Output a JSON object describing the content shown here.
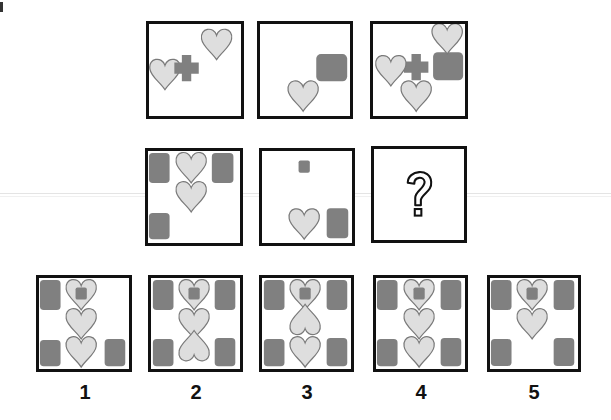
{
  "puzzle": {
    "type": "visual-analogy-matrix",
    "colors": {
      "heart_fill": "#dedede",
      "heart_stroke": "#7a7a7a",
      "block_fill": "#808080",
      "box_border": "#111111"
    },
    "matrix": {
      "row1": [
        {
          "cell": "A1",
          "contents": [
            "heart",
            "cross",
            "heart"
          ]
        },
        {
          "cell": "A2",
          "contents": [
            "heart",
            "rounded-square"
          ]
        },
        {
          "cell": "A3",
          "contents": [
            "heart",
            "cross",
            "rounded-square",
            "heart",
            "heart"
          ]
        }
      ],
      "row2": [
        {
          "cell": "B1",
          "contents": [
            "rounded-square",
            "heart",
            "rounded-square",
            "heart",
            "rounded-square"
          ]
        },
        {
          "cell": "B2",
          "contents": [
            "small-square",
            "heart",
            "rounded-square"
          ]
        },
        {
          "cell": "B3",
          "contents": [
            "question-mark"
          ],
          "symbol": "?"
        }
      ]
    },
    "options": [
      {
        "label": "1"
      },
      {
        "label": "2"
      },
      {
        "label": "3"
      },
      {
        "label": "4"
      },
      {
        "label": "5"
      }
    ]
  }
}
